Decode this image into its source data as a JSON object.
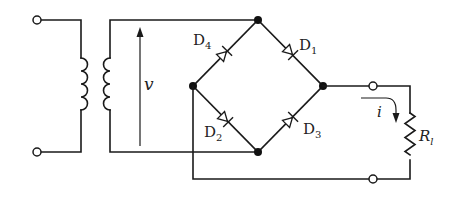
{
  "diagram": {
    "type": "circuit",
    "labels": {
      "voltage": "v",
      "current": "i",
      "load_main": "R",
      "load_sub": "l",
      "d1_main": "D",
      "d1_sub": "1",
      "d2_main": "D",
      "d2_sub": "2",
      "d3_main": "D",
      "d3_sub": "3",
      "d4_main": "D",
      "d4_sub": "4"
    },
    "components": [
      {
        "id": "T",
        "kind": "transformer",
        "primary_turns_drawn": 4,
        "secondary_turns_drawn": 4
      },
      {
        "id": "D1",
        "kind": "diode",
        "from": "top-node",
        "to": "right-node"
      },
      {
        "id": "D2",
        "kind": "diode",
        "from": "left-node",
        "to": "bottom-node"
      },
      {
        "id": "D3",
        "kind": "diode",
        "from": "bottom-node",
        "to": "right-node"
      },
      {
        "id": "D4",
        "kind": "diode",
        "from": "left-node",
        "to": "top-node"
      },
      {
        "id": "Rl",
        "kind": "resistor",
        "label": "R_l"
      }
    ],
    "colors": {
      "line": "#1a1a1a",
      "background": "#ffffff"
    }
  }
}
